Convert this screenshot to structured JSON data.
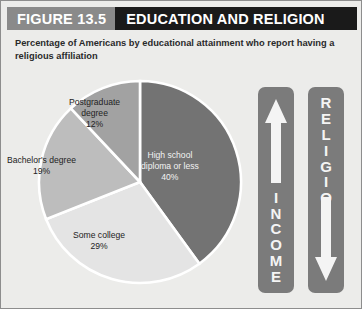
{
  "header": {
    "figure_number": "FIGURE 13.5",
    "title": "EDUCATION AND RELIGION",
    "num_bg": "#8a8a8a",
    "title_bg": "#1a1a1a"
  },
  "subtitle": "Percentage of Americans by educational attainment who report having a religious affiliation",
  "chart_data": {
    "type": "pie",
    "title": "EDUCATION AND RELIGION",
    "subtitle": "Percentage of Americans by educational attainment who report having a religious affiliation",
    "categories": [
      "High school diploma or less",
      "Some college",
      "Bachelor's degree",
      "Postgraduate degree"
    ],
    "values": [
      40,
      29,
      19,
      12
    ],
    "unit": "%",
    "colors": [
      "#737373",
      "#e4e4e4",
      "#bdbdbd",
      "#a2a2a2"
    ],
    "separator_color": "#ffffff",
    "start_angle_deg": 0,
    "direction": "clockwise",
    "legend": "none",
    "labels_inside": true,
    "slices": [
      {
        "label_line1": "High school",
        "label_line2": "diploma or less",
        "value_label": "40%",
        "value": 40,
        "color": "#737373",
        "text_color": "#f2f2f2"
      },
      {
        "label_line1": "Some college",
        "label_line2": "",
        "value_label": "29%",
        "value": 29,
        "color": "#e4e4e4",
        "text_color": "#232323"
      },
      {
        "label_line1": "Bachelor's degree",
        "label_line2": "",
        "value_label": "19%",
        "value": 19,
        "color": "#bdbdbd",
        "text_color": "#232323"
      },
      {
        "label_line1": "Postgraduate",
        "label_line2": "degree",
        "value_label": "12%",
        "value": 12,
        "color": "#a2a2a2",
        "text_color": "#232323"
      }
    ]
  },
  "arrows": {
    "income": {
      "word": "INCOME",
      "letters": [
        "I",
        "N",
        "C",
        "O",
        "M",
        "E"
      ],
      "direction": "up",
      "bar_color": "#7b7b7b",
      "arrow_color": "#f4f4f4"
    },
    "religion": {
      "word": "RELIGION",
      "letters": [
        "R",
        "E",
        "L",
        "I",
        "G",
        "I",
        "O",
        "N"
      ],
      "direction": "down",
      "bar_color": "#7b7b7b",
      "arrow_color": "#f4f4f4"
    }
  }
}
